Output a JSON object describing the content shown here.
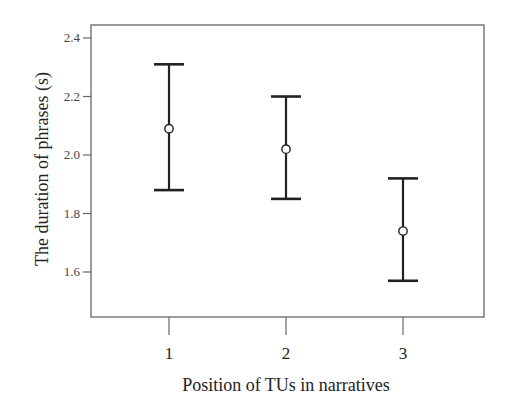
{
  "chart_data": {
    "type": "errorbar",
    "title": "",
    "xlabel": "Position of TUs in narratives",
    "ylabel": "The duration of phrases (s)",
    "categories": [
      "1",
      "2",
      "3"
    ],
    "series": [
      {
        "name": "Mean duration",
        "marker": "open-circle",
        "values": [
          2.09,
          2.02,
          1.74
        ],
        "upper": [
          2.31,
          2.2,
          1.92
        ],
        "lower": [
          1.88,
          1.85,
          1.57
        ]
      }
    ],
    "yticks": [
      1.6,
      1.8,
      2.0,
      2.2,
      2.4
    ],
    "ytick_labels": [
      "1.6",
      "1.8",
      "2.0",
      "2.2",
      "2.4"
    ],
    "ylim": [
      1.45,
      2.44
    ],
    "grid": false,
    "legend": null,
    "colors": {
      "line": "#222222",
      "frame": "#666666",
      "background": "#ffffff"
    }
  }
}
